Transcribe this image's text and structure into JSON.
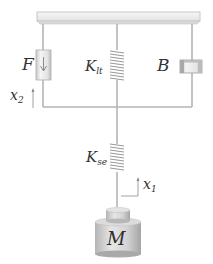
{
  "diagram": {
    "type": "mechanical-spring-damper-model",
    "labels": {
      "force": "F",
      "spring_top": {
        "base": "K",
        "sub": "lt"
      },
      "damper": "B",
      "spring_bottom": {
        "base": "K",
        "sub": "se"
      },
      "mass": "M",
      "x2": {
        "base": "x",
        "sub": "2"
      },
      "x1": {
        "base": "x",
        "sub": "1"
      }
    },
    "colors": {
      "line": "#b4b4b4",
      "bar_fill": "#efefef",
      "bar_stroke": "#c6c6c6",
      "spring": "#9a9a9a",
      "mass_light": "#e2e2e2",
      "mass_dark": "#a8a8a8",
      "text": "#333333"
    }
  }
}
